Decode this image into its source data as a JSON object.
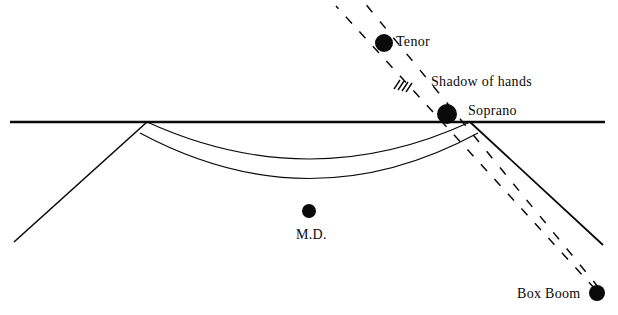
{
  "diagram": {
    "colors": {
      "ink": "#0a0a0a",
      "background": "#ffffff",
      "dot_fill": "#0a0a0a"
    },
    "labels": {
      "tenor": "Tenor",
      "shadow_of_hands": "Shadow of hands",
      "soprano": "Soprano",
      "md": "M.D.",
      "box_boom": "Box Boom"
    },
    "markers": [
      {
        "name": "tenor",
        "label": "Tenor",
        "cx": 384,
        "cy": 43,
        "r": 9
      },
      {
        "name": "soprano",
        "label": "Soprano",
        "cx": 447,
        "cy": 114,
        "r": 10
      },
      {
        "name": "md",
        "label": "M.D.",
        "cx": 309,
        "cy": 211,
        "r": 7
      },
      {
        "name": "box-boom",
        "label": "Box Boom",
        "cx": 597,
        "cy": 293,
        "r": 8
      }
    ],
    "stage_edge": {
      "name": "stage-front-edge",
      "style": "solid",
      "x1": 10,
      "y1": 122,
      "x2": 605,
      "y2": 122
    },
    "wings": [
      {
        "name": "left-wing-line",
        "style": "solid",
        "x1": 147,
        "y1": 122,
        "x2": 14,
        "y2": 242
      },
      {
        "name": "right-wing-line",
        "style": "solid",
        "x1": 470,
        "y1": 122,
        "x2": 603,
        "y2": 245
      }
    ],
    "pit_curves": [
      {
        "name": "orchestra-pit-upper-curve",
        "style": "solid",
        "path": "M 147,122 Q 310,196 470,122"
      },
      {
        "name": "orchestra-pit-lower-curve",
        "style": "solid",
        "path": "M 140,133 Q 310,224 478,133"
      }
    ],
    "beam_rays": [
      {
        "name": "box-boom-ray-upper",
        "style": "dashed",
        "x1": 597,
        "y1": 293,
        "x2": 336,
        "y2": 6
      },
      {
        "name": "box-boom-ray-lower",
        "style": "dashed",
        "x1": 597,
        "y1": 293,
        "x2": 364,
        "y2": 2
      }
    ],
    "hatch_marks": {
      "name": "shadow-of-hands-hatching",
      "count": 4,
      "cx": 400,
      "cy": 85
    }
  }
}
